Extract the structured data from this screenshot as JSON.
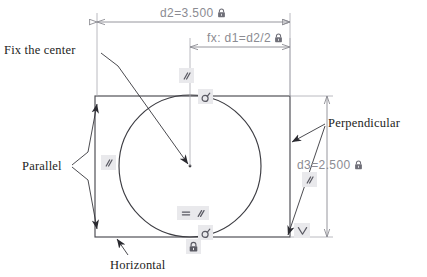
{
  "drawing": {
    "type": "cad-sketch-constraints",
    "background": "#ffffff",
    "geometry_color": "#3c3c42",
    "dimension_color": "#8b8b92",
    "annotation_color": "#1d1d22",
    "badge_color": "#e9e9ec"
  },
  "dimensions": [
    {
      "id": "d2",
      "name": "width-dimension",
      "text": "d2=3.500",
      "value": 3.5,
      "driven": false,
      "locked": true,
      "lock_icon": "padlock-icon",
      "orientation": "horizontal",
      "spans": "rectangle-top-left to rectangle-top-right"
    },
    {
      "id": "d1",
      "name": "half-width-dimension",
      "text": "fx: d1=d2/2",
      "expression": "d2/2",
      "value": 1.75,
      "driven": true,
      "locked": true,
      "lock_icon": "padlock-icon",
      "orientation": "horizontal",
      "spans": "circle-center to rectangle-right-edge"
    },
    {
      "id": "d3",
      "name": "height-dimension",
      "text": "d3=2.500",
      "value": 2.5,
      "driven": false,
      "locked": true,
      "lock_icon": "padlock-icon",
      "orientation": "vertical",
      "spans": "rectangle-top to rectangle-bottom"
    }
  ],
  "annotations": [
    {
      "id": "fix",
      "name": "fix-the-center-label",
      "text": "Fix the center",
      "points_to": "circle-center"
    },
    {
      "id": "parallel",
      "name": "parallel-label",
      "text": "Parallel",
      "points_to": "rectangle-left-edge-endpoints"
    },
    {
      "id": "horizontal",
      "name": "horizontal-label",
      "text": "Horizontal",
      "points_to": "rectangle-bottom-edge"
    },
    {
      "id": "perpendicular",
      "name": "perpendicular-label",
      "text": "Perpendicular",
      "points_to": "rectangle-right-edge-and-corner"
    }
  ],
  "constraint_badges": [
    {
      "id": "b1",
      "name": "parallel-badge-top",
      "glyphs": [
        "parallel-icon"
      ],
      "x": 179,
      "y": 68
    },
    {
      "id": "b2",
      "name": "coincident-badge-top",
      "glyphs": [
        "coincident-point-icon"
      ],
      "x": 198,
      "y": 89
    },
    {
      "id": "b3",
      "name": "parallel-badge-left",
      "glyphs": [
        "parallel-icon"
      ],
      "x": 101,
      "y": 155
    },
    {
      "id": "b4",
      "name": "parallel-badge-right",
      "glyphs": [
        "parallel-icon"
      ],
      "x": 302,
      "y": 172
    },
    {
      "id": "b5",
      "name": "equal-parallel-badge-bottom",
      "glyphs": [
        "equal-icon",
        "parallel-icon"
      ],
      "x": 177,
      "y": 207
    },
    {
      "id": "b6",
      "name": "coincident-badge-bottom",
      "glyphs": [
        "coincident-point-icon"
      ],
      "x": 198,
      "y": 225
    },
    {
      "id": "b7",
      "name": "fix-badge-bottom",
      "glyphs": [
        "padlock-icon"
      ],
      "x": 186,
      "y": 240
    },
    {
      "id": "b8",
      "name": "perpendicular-badge-corner",
      "glyphs": [
        "perpendicular-icon"
      ],
      "x": 294,
      "y": 224
    }
  ],
  "shapes": {
    "rectangle": {
      "name": "sketch-rectangle",
      "x": 95,
      "y": 96,
      "width": 195,
      "height": 141
    },
    "circle": {
      "name": "sketch-circle",
      "cx": 190,
      "cy": 166,
      "r": 71
    },
    "center_point": {
      "name": "circle-center-point",
      "x": 190,
      "y": 166
    }
  }
}
